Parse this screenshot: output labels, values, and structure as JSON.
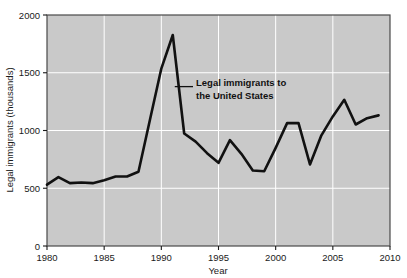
{
  "chart_data": {
    "type": "line",
    "title": "",
    "xlabel": "Year",
    "ylabel": "Legal immigrants (thousands)",
    "xlim": [
      1980,
      2010
    ],
    "ylim": [
      0,
      2000
    ],
    "xticks": [
      1980,
      1985,
      1990,
      1995,
      2000,
      2005,
      2010
    ],
    "xticklabels": [
      "1980",
      "1985",
      "1990",
      "1995",
      "2000",
      "2005",
      "2010"
    ],
    "yticks": [
      0,
      500,
      1000,
      1500,
      2000
    ],
    "yticklabels": [
      "0",
      "500",
      "1000",
      "1500",
      "2000"
    ],
    "grid": true,
    "grid_color": "#ffffff",
    "plot_background": "#c9c9c9",
    "line_color": "#111111",
    "legend": "none",
    "annotations": [
      {
        "name": "series-callout",
        "text_line_1": "Legal immigrants to",
        "text_line_2": "the United States",
        "points_to_year": 1991,
        "points_to_value": 1380
      }
    ],
    "series": [
      {
        "name": "Legal immigrants to the United States",
        "x": [
          1980,
          1981,
          1982,
          1983,
          1984,
          1985,
          1986,
          1987,
          1988,
          1989,
          1990,
          1991,
          1992,
          1993,
          1994,
          1995,
          1996,
          1997,
          1998,
          1999,
          2000,
          2001,
          2002,
          2003,
          2004,
          2005,
          2006,
          2007,
          2008,
          2009
        ],
        "values": [
          531,
          597,
          544,
          550,
          544,
          570,
          602,
          602,
          643,
          1091,
          1536,
          1827,
          974,
          904,
          804,
          720,
          916,
          798,
          654,
          647,
          850,
          1064,
          1064,
          706,
          958,
          1122,
          1266,
          1052,
          1107,
          1131
        ]
      }
    ]
  }
}
